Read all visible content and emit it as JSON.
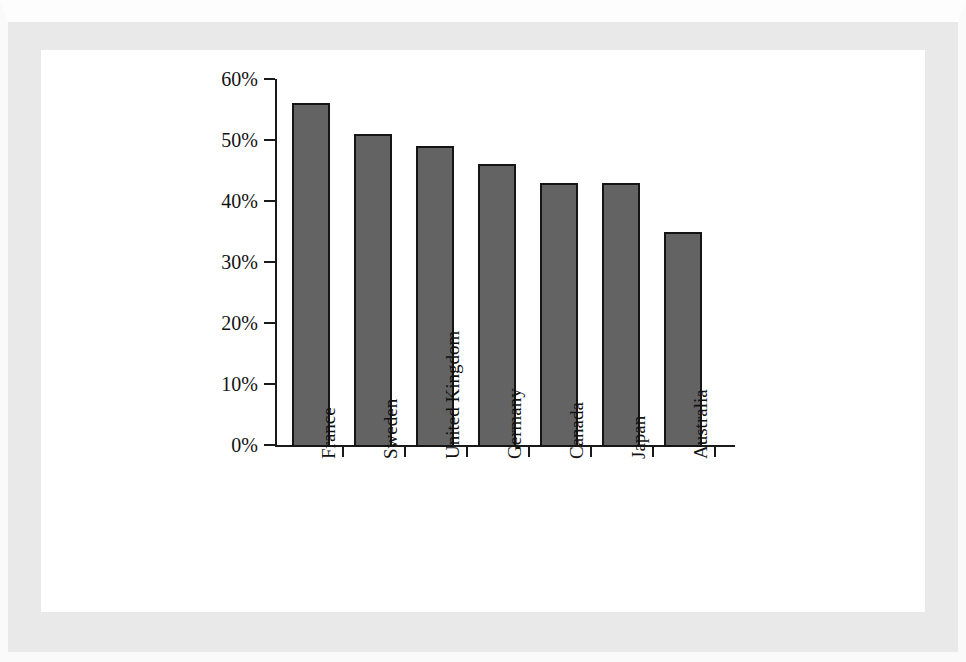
{
  "chart_data": {
    "type": "bar",
    "title": "",
    "subtitle": "",
    "xlabel": "",
    "ylabel": "",
    "categories": [
      "France",
      "Sweden",
      "United Kingdom",
      "Germany",
      "Canada",
      "Japan",
      "Australia"
    ],
    "values": [
      56,
      51,
      49,
      46,
      43,
      43,
      35
    ],
    "value_unit": "%",
    "ylim": [
      0,
      60
    ],
    "ytick_values": [
      0,
      10,
      20,
      30,
      40,
      50,
      60
    ],
    "ytick_labels": [
      "0%",
      "10%",
      "20%",
      "30%",
      "40%",
      "50%",
      "60%"
    ],
    "grid": false,
    "legend": false,
    "legend_position": "none",
    "series": [
      {
        "name": "",
        "values": [
          56,
          51,
          49,
          46,
          43,
          43,
          35
        ]
      }
    ],
    "bar_color": "#636363",
    "bar_edge_color": "#151515",
    "axis_color": "#1a1a1a",
    "background_color": "#ffffff",
    "page_margin_color": "#e9e9e9",
    "category_label_rotation": 90
  },
  "figure": {
    "panel_background": "#ffffff",
    "margin_background": "#e9e9e9"
  }
}
